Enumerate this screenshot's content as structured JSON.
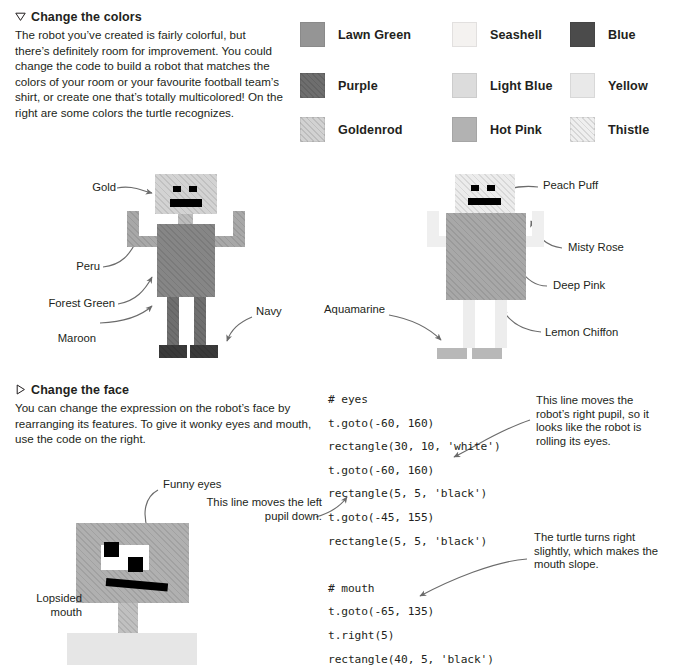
{
  "page": {
    "width": 674,
    "height": 671,
    "background": "#ffffff",
    "text_color": "#231f20"
  },
  "sections": [
    {
      "id": "change-the-colors",
      "marker": "triangle-down-outline-icon",
      "title": "Change the colors",
      "body": "The robot you’ve created is fairly colorful, but there’s definitely room for improvement. You could change the code to build a robot that matches the colors of your room or your favourite football team’s shirt, or create one that’s totally multicolored! On the right are some colors the turtle recognizes."
    },
    {
      "id": "change-the-face",
      "marker": "triangle-right-outline-icon",
      "title": "Change the face",
      "body": "You can change the expression on the robot’s face by rearranging its features. To give it wonky eyes and mouth, use the code on the right."
    }
  ],
  "color_legend": {
    "columns": 3,
    "rows": 3,
    "swatches": [
      {
        "label": "Lawn Green",
        "fill": "#959595",
        "hatched": false
      },
      {
        "label": "Seashell",
        "fill": "#f4f2f0",
        "hatched": false
      },
      {
        "label": "Blue",
        "fill": "#4b4b4b",
        "hatched": false
      },
      {
        "label": "Purple",
        "fill": "#6e6e6e",
        "hatched": true
      },
      {
        "label": "Light Blue",
        "fill": "#dcdcdc",
        "hatched": false
      },
      {
        "label": "Yellow",
        "fill": "#e9e9e9",
        "hatched": false
      },
      {
        "label": "Goldenrod",
        "fill": "#d2d2d2",
        "hatched": true
      },
      {
        "label": "Hot Pink",
        "fill": "#b2b2b2",
        "hatched": false
      },
      {
        "label": "Thistle",
        "fill": "#efefef",
        "hatched": true
      }
    ]
  },
  "robot_left": {
    "caption_ids": [
      "Gold",
      "Peru",
      "Forest Green",
      "Maroon",
      "Navy"
    ],
    "labels": {
      "head": "Gold",
      "arms": "Peru",
      "body": "Forest Green",
      "legs": "Maroon",
      "feet": "Navy"
    },
    "colors": {
      "head": "#d3d3d3",
      "arms": "#a8a8a8",
      "body": "#868686",
      "legs": "#6f6f6f",
      "feet": "#3a3a3a",
      "eyes": "#000000",
      "mouth": "#000000"
    }
  },
  "robot_right": {
    "labels": {
      "head": "Peach Puff",
      "arms": "Misty Rose",
      "body": "Deep Pink",
      "legs": "Lemon Chiffon",
      "feet": "Aquamarine"
    },
    "colors": {
      "head": "#ececec",
      "arms": "#efefef",
      "body": "#a8a8a8",
      "legs": "#ededed",
      "feet": "#b8b8b8",
      "eyes": "#000000",
      "mouth": "#000000"
    }
  },
  "robot_face": {
    "labels": {
      "eyes": "Funny eyes",
      "mouth_line1": "Lopsided",
      "mouth_line2": "mouth"
    },
    "colors": {
      "head": "#b0b0b0",
      "neck": "#c0c0c0",
      "body": "#e6e6e6",
      "eye_white": "#ffffff",
      "pupil": "#000000",
      "mouth": "#000000"
    }
  },
  "code_block": {
    "lines": [
      "# eyes",
      "t.goto(-60, 160)",
      "rectangle(30, 10, 'white')",
      "t.goto(-60, 160)",
      "rectangle(5, 5, 'black')",
      "t.goto(-45, 155)",
      "rectangle(5, 5, 'black')",
      "",
      "# mouth",
      "t.goto(-65, 135)",
      "t.right(5)",
      "rectangle(40, 5, 'black')"
    ]
  },
  "callouts": [
    {
      "id": "right-pupil-note",
      "text": "This line moves the robot’s right pupil, so it looks like the robot is rolling its eyes."
    },
    {
      "id": "left-pupil-note",
      "text": "This line moves the left pupil down."
    },
    {
      "id": "mouth-slope-note",
      "text": "The turtle turns right slightly, which makes the mouth slope."
    }
  ]
}
